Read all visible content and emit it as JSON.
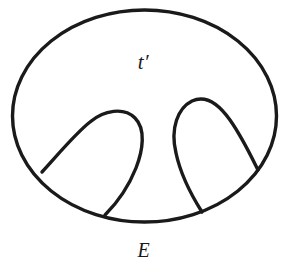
{
  "figure": {
    "kind": "topological-diagram",
    "background_color": "#ffffff",
    "stroke_color": "#1a1a1a",
    "stroke_width": 3.4,
    "labels": [
      {
        "id": "interior-region",
        "text": "t′",
        "x": 144,
        "y": 62,
        "style": "italic"
      },
      {
        "id": "figure-caption",
        "text": "E",
        "x": 144,
        "y": 250,
        "style": "italic"
      }
    ],
    "shapes": {
      "outer_boundary": {
        "name": "outer-ellipse",
        "type": "ellipse",
        "cx": 144.5,
        "cy": 116,
        "rx": 132,
        "ry": 106
      },
      "inner_loops": [
        {
          "name": "left-tongue",
          "apex_x": 112,
          "apex_y": 114,
          "foot_left_x": 42,
          "foot_left_y": 172,
          "foot_right_x": 105,
          "foot_right_y": 215
        },
        {
          "name": "right-tongue",
          "apex_x": 196,
          "apex_y": 100,
          "foot_left_x": 202,
          "foot_left_y": 212,
          "foot_right_x": 258,
          "foot_right_y": 170
        }
      ]
    },
    "paths": {
      "outer_ellipse": "M 12.5,116 A 132,106 0 1 1 276.5,116 A 132,106 0 1 1 12.5,116 Z",
      "left_tongue": "M 42,172 C 62,150 76,133 90,122 C 104,110 124,107 135,118 C 146,129 143,150 136,168 C 128,188 115,205 105,215",
      "right_tongue": "M 202,212 C 190,193 180,172 176,153 C 170,128 178,108 192,101 C 205,95 218,103 230,120 C 242,137 252,158 258,170"
    }
  }
}
